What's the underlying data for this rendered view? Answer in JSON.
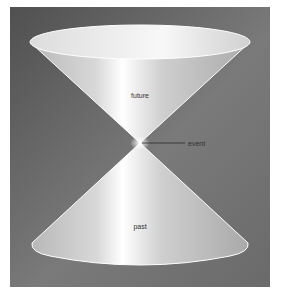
{
  "diagram": {
    "type": "light-cone",
    "labels": {
      "future": "future",
      "event": "event",
      "past": "past"
    },
    "colors": {
      "background_outer": "#ffffff",
      "panel_dark": "#5a5a5a",
      "panel_light": "#8a8a8a",
      "cone_light": "#f4f4f4",
      "cone_mid": "#bdbdbd",
      "cone_edge": "#ffffff",
      "leader_line": "#333333"
    }
  }
}
